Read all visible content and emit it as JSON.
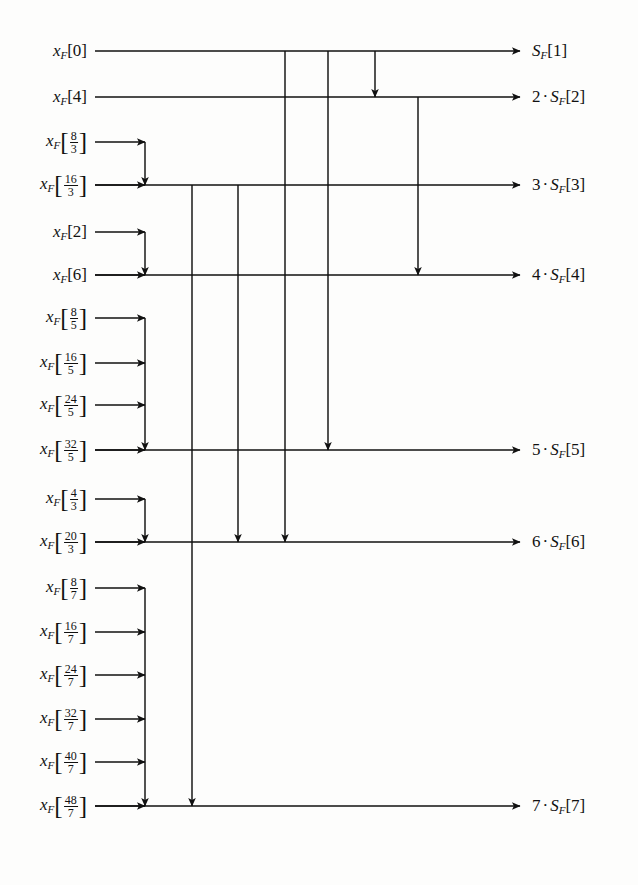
{
  "diagram": {
    "type": "signal-flow",
    "line_color": "#111111",
    "background": "#ffffff",
    "bus_x": 145,
    "output_arrow_x": 520,
    "inputs": [
      {
        "id": "in-0",
        "var": "x",
        "sub": "F",
        "kind": "int",
        "value": "0",
        "y": 51,
        "is_bus_row": true,
        "feeder": false
      },
      {
        "id": "in-4",
        "var": "x",
        "sub": "F",
        "kind": "int",
        "value": "4",
        "y": 97,
        "is_bus_row": true,
        "feeder": false
      },
      {
        "id": "in-8-3",
        "var": "x",
        "sub": "F",
        "kind": "frac",
        "num": "8",
        "den": "3",
        "y": 142,
        "is_bus_row": false,
        "feeder": true
      },
      {
        "id": "in-16-3",
        "var": "x",
        "sub": "F",
        "kind": "frac",
        "num": "16",
        "den": "3",
        "y": 185,
        "is_bus_row": true,
        "feeder": true
      },
      {
        "id": "in-2",
        "var": "x",
        "sub": "F",
        "kind": "int",
        "value": "2",
        "y": 232,
        "is_bus_row": false,
        "feeder": true
      },
      {
        "id": "in-6",
        "var": "x",
        "sub": "F",
        "kind": "int",
        "value": "6",
        "y": 275,
        "is_bus_row": true,
        "feeder": true
      },
      {
        "id": "in-8-5",
        "var": "x",
        "sub": "F",
        "kind": "frac",
        "num": "8",
        "den": "5",
        "y": 318,
        "is_bus_row": false,
        "feeder": true
      },
      {
        "id": "in-16-5",
        "var": "x",
        "sub": "F",
        "kind": "frac",
        "num": "16",
        "den": "5",
        "y": 363,
        "is_bus_row": false,
        "feeder": true
      },
      {
        "id": "in-24-5",
        "var": "x",
        "sub": "F",
        "kind": "frac",
        "num": "24",
        "den": "5",
        "y": 405,
        "is_bus_row": false,
        "feeder": true
      },
      {
        "id": "in-32-5",
        "var": "x",
        "sub": "F",
        "kind": "frac",
        "num": "32",
        "den": "5",
        "y": 450,
        "is_bus_row": true,
        "feeder": true
      },
      {
        "id": "in-4-3",
        "var": "x",
        "sub": "F",
        "kind": "frac",
        "num": "4",
        "den": "3",
        "y": 499,
        "is_bus_row": false,
        "feeder": true
      },
      {
        "id": "in-20-3",
        "var": "x",
        "sub": "F",
        "kind": "frac",
        "num": "20",
        "den": "3",
        "y": 542,
        "is_bus_row": true,
        "feeder": true
      },
      {
        "id": "in-8-7",
        "var": "x",
        "sub": "F",
        "kind": "frac",
        "num": "8",
        "den": "7",
        "y": 588,
        "is_bus_row": false,
        "feeder": true
      },
      {
        "id": "in-16-7",
        "var": "x",
        "sub": "F",
        "kind": "frac",
        "num": "16",
        "den": "7",
        "y": 632,
        "is_bus_row": false,
        "feeder": true
      },
      {
        "id": "in-24-7",
        "var": "x",
        "sub": "F",
        "kind": "frac",
        "num": "24",
        "den": "7",
        "y": 675,
        "is_bus_row": false,
        "feeder": true
      },
      {
        "id": "in-32-7",
        "var": "x",
        "sub": "F",
        "kind": "frac",
        "num": "32",
        "den": "7",
        "y": 719,
        "is_bus_row": false,
        "feeder": true
      },
      {
        "id": "in-40-7",
        "var": "x",
        "sub": "F",
        "kind": "frac",
        "num": "40",
        "den": "7",
        "y": 762,
        "is_bus_row": false,
        "feeder": true
      },
      {
        "id": "in-48-7",
        "var": "x",
        "sub": "F",
        "kind": "frac",
        "num": "48",
        "den": "7",
        "y": 806,
        "is_bus_row": true,
        "feeder": true
      }
    ],
    "outputs": [
      {
        "id": "out-1",
        "coef": "",
        "var": "S",
        "sub": "F",
        "index": "1",
        "y": 51,
        "text": "S_F[1]"
      },
      {
        "id": "out-2",
        "coef": "2",
        "var": "S",
        "sub": "F",
        "index": "2",
        "y": 97,
        "text": "2 . S_F[2]"
      },
      {
        "id": "out-3",
        "coef": "3",
        "var": "S",
        "sub": "F",
        "index": "3",
        "y": 185,
        "text": "3 . S_F[3]"
      },
      {
        "id": "out-4",
        "coef": "4",
        "var": "S",
        "sub": "F",
        "index": "4",
        "y": 275,
        "text": "4 . S_F[4]"
      },
      {
        "id": "out-5",
        "coef": "5",
        "var": "S",
        "sub": "F",
        "index": "5",
        "y": 450,
        "text": "5 . S_F[5]"
      },
      {
        "id": "out-6",
        "coef": "6",
        "var": "S",
        "sub": "F",
        "index": "6",
        "y": 542,
        "text": "6 . S_F[6]"
      },
      {
        "id": "out-7",
        "coef": "7",
        "var": "S",
        "sub": "F",
        "index": "7",
        "y": 806,
        "text": "7 . S_F[7]"
      }
    ],
    "bus_groups": [
      {
        "id": "group-3",
        "bus_x": 145,
        "from_y": 142,
        "to_y": 185,
        "feeder_ys": [
          142
        ],
        "target": "out-3"
      },
      {
        "id": "group-4",
        "bus_x": 145,
        "from_y": 232,
        "to_y": 275,
        "feeder_ys": [
          232
        ],
        "target": "out-4"
      },
      {
        "id": "group-5",
        "bus_x": 145,
        "from_y": 318,
        "to_y": 450,
        "feeder_ys": [
          318,
          363,
          405
        ],
        "target": "out-5"
      },
      {
        "id": "group-6",
        "bus_x": 145,
        "from_y": 499,
        "to_y": 542,
        "feeder_ys": [
          499
        ],
        "target": "out-6"
      },
      {
        "id": "group-7",
        "bus_x": 145,
        "from_y": 588,
        "to_y": 806,
        "feeder_ys": [
          588,
          632,
          675,
          719,
          762
        ],
        "target": "out-7"
      }
    ],
    "connectors": [
      {
        "id": "conn-1-to-6",
        "x": 285,
        "from_y": 51,
        "to_y": 542,
        "source_row": "x_F[0]",
        "dest_row": "6 . S_F[6]"
      },
      {
        "id": "conn-1-to-5",
        "x": 328,
        "from_y": 51,
        "to_y": 450,
        "source_row": "x_F[0]",
        "dest_row": "5 . S_F[5]"
      },
      {
        "id": "conn-1-to-2",
        "x": 375,
        "from_y": 51,
        "to_y": 97,
        "source_row": "x_F[0]",
        "dest_row": "2 . S_F[2]"
      },
      {
        "id": "conn-2-to-4",
        "x": 418,
        "from_y": 97,
        "to_y": 275,
        "source_row": "x_F[4]",
        "dest_row": "4 . S_F[4]"
      },
      {
        "id": "conn-3-to-6",
        "x": 238,
        "from_y": 185,
        "to_y": 542,
        "source_row": "x_F[16/3]",
        "dest_row": "6 . S_F[6]"
      },
      {
        "id": "conn-3-to-7",
        "x": 192,
        "from_y": 185,
        "to_y": 806,
        "source_row": "x_F[16/3]",
        "dest_row": "7 . S_F[7]"
      }
    ]
  }
}
